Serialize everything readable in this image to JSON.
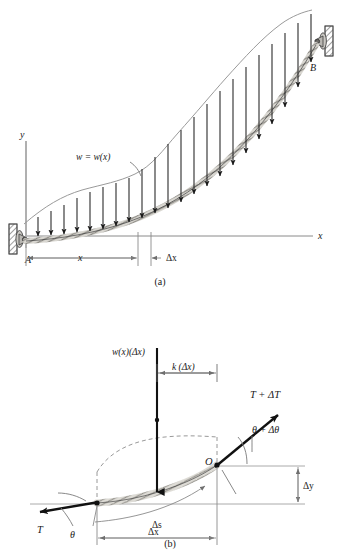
{
  "figure": {
    "kind": "engineering-diagram",
    "background_color": "#ffffff",
    "ink_color": "#1a1a1a",
    "thin_line_color": "#8a8a8a",
    "cable_fill_color": "#d8d6d0",
    "wall_hatch_color": "#6b6b6b"
  },
  "panel_a": {
    "caption": "(a)",
    "axis_y_label": "y",
    "axis_x_label": "x",
    "support_left_label": "A",
    "support_right_label": "B",
    "load_label": "w = w(x)",
    "dim_x_label": "x",
    "dim_dx_label": "Δx",
    "load_arrow_count": 22
  },
  "panel_b": {
    "caption": "(b)",
    "load_label": "w(x)(Δx)",
    "moment_arm_label": "k (Δx)",
    "tension_left_label": "T",
    "angle_left_label": "θ",
    "tension_right_label": "T + ΔT",
    "angle_right_label": "θ + Δθ",
    "origin_label": "O",
    "arc_length_label": "Δs",
    "dim_dx_label": "Δx",
    "dim_dy_label": "Δy"
  }
}
